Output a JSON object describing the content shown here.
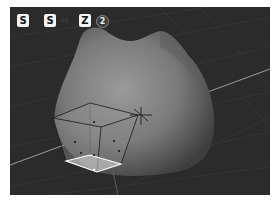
{
  "viewport": {
    "background": "#2b2b2b",
    "object_color": "#7a7a7a",
    "cage_color": "#1a1a1a",
    "selected_face_color": "#ffffff",
    "axis_color": "#a8a8a8"
  },
  "shortcut_overlay": {
    "keys": [
      {
        "label": "S"
      },
      {
        "label": "S"
      },
      {
        "label": "Z"
      }
    ],
    "arrow": "⇨",
    "step_badge": "2"
  }
}
